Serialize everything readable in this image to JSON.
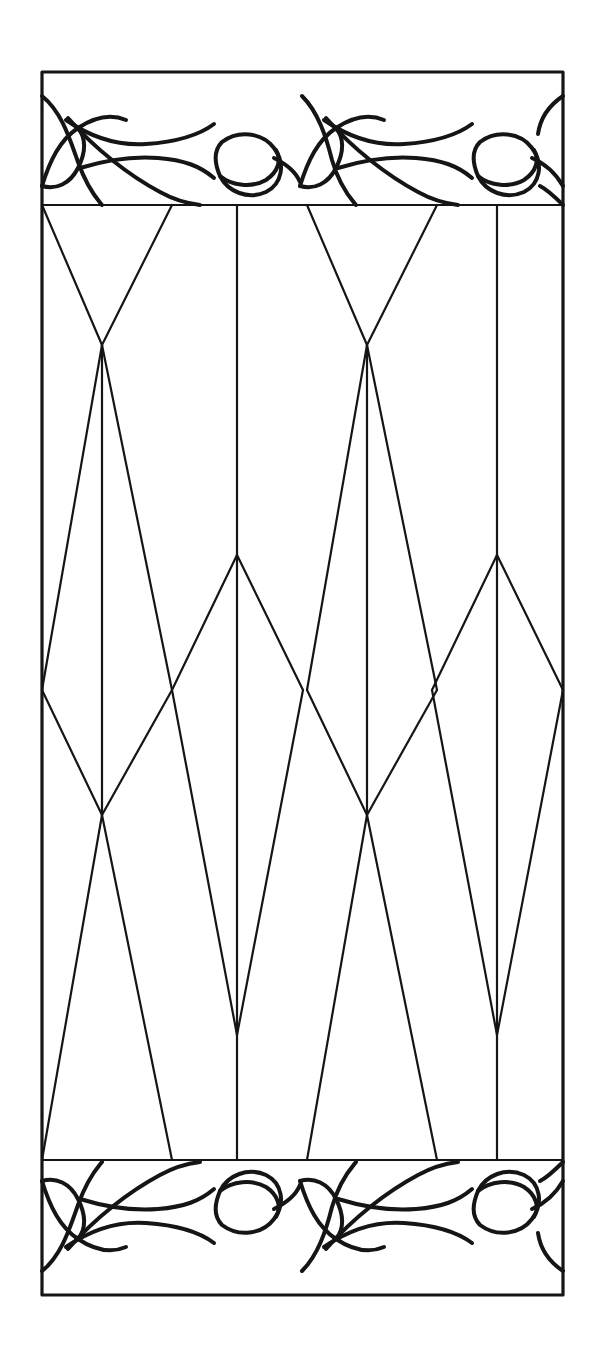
{
  "document": {
    "title": "Stained Glass Window Pattern",
    "kind": "line-art-pattern",
    "background_color": "#ffffff",
    "line_color": "#151515",
    "canvas": {
      "width": 602,
      "height": 1363
    }
  },
  "panel": {
    "name": "rectangular-window-panel",
    "frame": {
      "x1": 42,
      "y1": 72,
      "x2": 563,
      "y2": 1295
    },
    "frame_stroke_width": 3.2,
    "lead_stroke_width": 2.2,
    "vine_stroke_width": 4.0
  },
  "lattice": {
    "description": "Elongated diamond / lozenge leaded lattice",
    "vertical_mullions_x": [
      102,
      237,
      367,
      497
    ],
    "border_x": [
      42,
      563
    ],
    "crossing_row_y": 690,
    "crossing_points_x": [
      42,
      172,
      302,
      432,
      563
    ],
    "column_a_x": [
      102,
      367
    ],
    "column_a_upper_vertex_y": 345,
    "column_a_lower_vertex_y": 815,
    "column_b_x": [
      237,
      497
    ],
    "column_b_upper_apex_y": 555,
    "column_b_lower_apex_y": 1035,
    "top_band_y": 205,
    "bottom_band_y": 1160
  },
  "ornament": {
    "name": "leaf-and-bud-vine-border",
    "placement": [
      "top-band",
      "bottom-band"
    ],
    "motifs": [
      {
        "id": "top-left-leaf-cluster",
        "type": "leaf-cluster"
      },
      {
        "id": "top-left-bud",
        "type": "bud"
      },
      {
        "id": "top-center-leaf-cluster",
        "type": "leaf-cluster"
      },
      {
        "id": "top-center-bud",
        "type": "bud"
      },
      {
        "id": "top-right-leaf-cluster",
        "type": "leaf-cluster"
      },
      {
        "id": "top-right-bud",
        "type": "bud"
      },
      {
        "id": "bottom-left-bud",
        "type": "bud"
      },
      {
        "id": "bottom-left-leaf-cluster",
        "type": "leaf-cluster"
      },
      {
        "id": "bottom-center-bud",
        "type": "bud"
      },
      {
        "id": "bottom-center-leaf-cluster",
        "type": "leaf-cluster"
      },
      {
        "id": "bottom-right-leaf-cluster",
        "type": "leaf-cluster"
      }
    ],
    "symmetry": "bottom band is a 180-degree rotation / vertical mirror of the top band"
  }
}
